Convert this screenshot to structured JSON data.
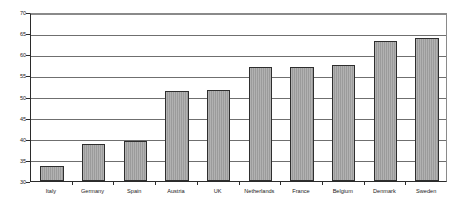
{
  "chart_data": {
    "type": "bar",
    "title": "",
    "subtitle": "",
    "xlabel": "",
    "ylabel": "",
    "categories": [
      "Italy",
      "Germany",
      "Spain",
      "Austria",
      "UK",
      "Netherlands",
      "France",
      "Belgium",
      "Denmark",
      "Sweden"
    ],
    "values": [
      33.5,
      38.7,
      39.4,
      51.3,
      51.5,
      57.0,
      57.1,
      57.5,
      63.1,
      63.9
    ],
    "series": [
      {
        "name": "",
        "values": [
          33.5,
          38.7,
          39.4,
          51.3,
          51.5,
          57.0,
          57.1,
          57.5,
          63.1,
          63.9
        ]
      }
    ],
    "ylim": [
      30,
      70
    ],
    "yticks": [
      30,
      35,
      40,
      45,
      50,
      55,
      60,
      65,
      70
    ],
    "ytick_labels": [
      "30",
      "35",
      "40",
      "45",
      "50",
      "55",
      "60",
      "65",
      "70"
    ],
    "grid": true,
    "grid_axis": "y",
    "legend": false,
    "legend_position": "none",
    "bar_color": "#a3a3a3",
    "bar_border_color": "#2e2e2e",
    "gridline_color": "#6f6f6f",
    "axis_color": "#2b2b2b",
    "background_color": "#ffffff",
    "annotations": []
  }
}
